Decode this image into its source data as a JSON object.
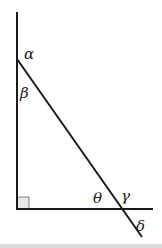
{
  "diagram": {
    "type": "geometry-angles",
    "colors": {
      "line": "#1a1a1a",
      "right_angle_fill": "#e6e6e6",
      "background": "#ffffff"
    },
    "labels": {
      "alpha": "α",
      "beta": "β",
      "theta": "θ",
      "gamma": "γ",
      "delta": "δ"
    },
    "right_angle_marker": true
  }
}
